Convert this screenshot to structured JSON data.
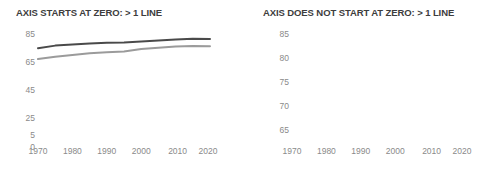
{
  "chart_data": [
    {
      "type": "line",
      "id": "axis-starts-at-zero",
      "title": "AXIS STARTS AT ZERO: > 1 LINE",
      "xlabel": "",
      "ylabel": "",
      "grid": false,
      "legend": "none",
      "xlim": [
        1970,
        2020
      ],
      "ylim": [
        0,
        85
      ],
      "xticks": [
        "1970",
        "1980",
        "1990",
        "2000",
        "2010",
        "2020"
      ],
      "yticks": [
        "0",
        "5",
        "25",
        "45",
        "65",
        "85"
      ],
      "ytick_values": [
        0,
        5,
        25,
        45,
        65,
        85
      ],
      "x": [
        1970,
        1975,
        1980,
        1985,
        1990,
        1995,
        2000,
        2005,
        2010,
        2015,
        2020
      ],
      "series": [
        {
          "name": "dark-line",
          "color": "#4a4a4a",
          "values": [
            74.9,
            76.7,
            77.5,
            78.2,
            78.8,
            79.0,
            79.6,
            80.4,
            81.1,
            81.6,
            81.4
          ]
        },
        {
          "name": "light-line",
          "color": "#9b9b9b",
          "values": [
            67.1,
            68.8,
            70.0,
            71.2,
            71.9,
            72.5,
            74.3,
            75.2,
            76.0,
            76.4,
            76.3
          ]
        }
      ]
    },
    {
      "type": "line",
      "id": "axis-does-not-start-at-zero",
      "title": "AXIS DOES NOT START AT ZERO: > 1 LINE",
      "xlabel": "",
      "ylabel": "",
      "grid": false,
      "legend": "none",
      "xlim": [
        1970,
        2020
      ],
      "ylim": [
        65,
        85
      ],
      "xticks": [
        "1970",
        "1980",
        "1990",
        "2000",
        "2010",
        "2020"
      ],
      "yticks": [
        "65",
        "70",
        "75",
        "80",
        "85"
      ],
      "ytick_values": [
        65,
        70,
        75,
        80,
        85
      ],
      "x": [
        1970,
        1975,
        1980,
        1985,
        1990,
        1995,
        2000,
        2005,
        2010,
        2015,
        2020
      ],
      "series": [
        {
          "name": "dark-line",
          "color": "#4a4a4a",
          "values": [
            74.9,
            76.7,
            77.5,
            78.2,
            78.8,
            79.0,
            79.6,
            80.4,
            81.1,
            81.6,
            81.4
          ]
        },
        {
          "name": "light-line",
          "color": "#9b9b9b",
          "values": [
            67.1,
            68.8,
            70.0,
            71.2,
            71.9,
            72.5,
            74.3,
            75.2,
            76.0,
            76.4,
            76.3
          ]
        }
      ]
    }
  ]
}
